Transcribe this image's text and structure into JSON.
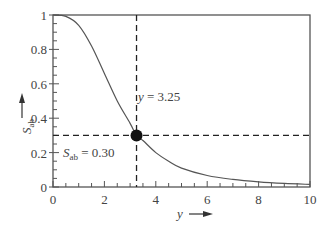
{
  "chart_data": {
    "type": "line",
    "title": "",
    "xlabel": "y",
    "ylabel": "S_ab",
    "xlim": [
      0,
      10
    ],
    "ylim": [
      0,
      1
    ],
    "x_ticks": [
      "0",
      "2",
      "4",
      "6",
      "8",
      "10"
    ],
    "y_ticks": [
      "0",
      "0.2",
      "0.4",
      "0.6",
      "0.8",
      "1"
    ],
    "grid": false,
    "legend": null,
    "series": [
      {
        "name": "S_ab(y)",
        "x": [
          0,
          0.5,
          1,
          1.5,
          2,
          2.5,
          3,
          3.25,
          3.5,
          4,
          4.5,
          5,
          6,
          7,
          8,
          9,
          10
        ],
        "values": [
          1.0,
          0.992,
          0.94,
          0.82,
          0.66,
          0.5,
          0.37,
          0.3,
          0.27,
          0.2,
          0.15,
          0.11,
          0.067,
          0.044,
          0.03,
          0.021,
          0.015
        ]
      }
    ],
    "annotations": [
      {
        "text_var": "y",
        "text_value": "= 3.25",
        "type": "vertical-dashed-line",
        "x": 3.25
      },
      {
        "text_var": "S",
        "text_sub": "ab",
        "text_value": "= 0.30",
        "type": "horizontal-dashed-line",
        "y": 0.3
      },
      {
        "type": "marker",
        "x": 3.25,
        "y": 0.3
      }
    ]
  },
  "labels": {
    "x_axis_var": "y",
    "y_axis_var": "S",
    "y_axis_sub": "ab",
    "vline_var": "y",
    "vline_text": " = 3.25",
    "hline_var": "S",
    "hline_sub": "ab",
    "hline_text": " = 0.30"
  }
}
